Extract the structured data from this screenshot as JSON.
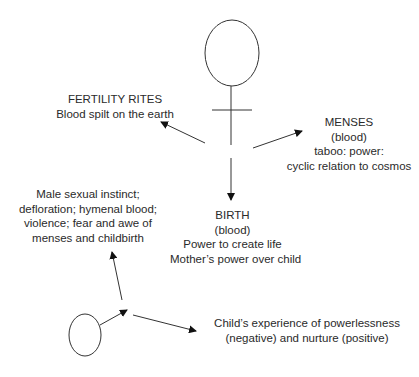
{
  "diagram": {
    "nodes": {
      "fertility": {
        "lines": [
          "FERTILITY RITES",
          "Blood spilt on the earth"
        ]
      },
      "menses": {
        "lines": [
          "MENSES",
          "(blood)",
          "taboo: power:",
          "cyclic relation to cosmos"
        ]
      },
      "birth": {
        "lines": [
          "BIRTH",
          "(blood)",
          "Power to create life",
          "Mother’s power over child"
        ]
      },
      "male": {
        "lines": [
          "Male sexual instinct;",
          "defloration; hymenal blood;",
          "violence; fear and awe of",
          "menses and childbirth"
        ]
      },
      "child": {
        "lines": [
          "Child’s experience of powerlessness",
          "(negative) and nurture (positive)"
        ]
      }
    },
    "symbols": {
      "female": "female-symbol",
      "circle": "small-circle"
    },
    "colors": {
      "stroke": "#333333",
      "text": "#2a2a2a",
      "background": "#ffffff"
    }
  }
}
